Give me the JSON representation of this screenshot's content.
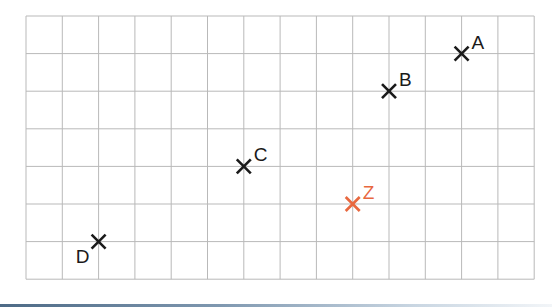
{
  "diagram": {
    "type": "grid-points",
    "grid": {
      "columns": 14,
      "rows": 7,
      "origin_px": [
        26,
        16
      ],
      "cell_width_px": 36.3,
      "cell_height_px": 37.6,
      "line_color": "#b9b9b9",
      "background": "#ffffff"
    },
    "points": [
      {
        "label": "A",
        "col": 12,
        "row": 1,
        "color": "#1a1a1a",
        "label_position": "upper-right"
      },
      {
        "label": "B",
        "col": 10,
        "row": 2,
        "color": "#1a1a1a",
        "label_position": "upper-right"
      },
      {
        "label": "C",
        "col": 6,
        "row": 4,
        "color": "#1a1a1a",
        "label_position": "upper-right"
      },
      {
        "label": "D",
        "col": 2,
        "row": 6,
        "color": "#1a1a1a",
        "label_position": "lower-left"
      },
      {
        "label": "Z",
        "col": 9,
        "row": 5,
        "color": "#e8683f",
        "label_position": "upper-right"
      }
    ],
    "marker": "cross"
  }
}
